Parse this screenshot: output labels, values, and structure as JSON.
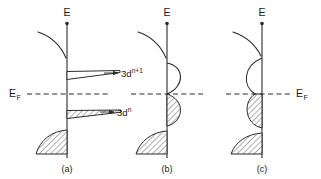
{
  "figure": {
    "background_color": "#ffffff",
    "line_color": "#2b2b2b",
    "energy_axis_label": "E",
    "fermi_label_main": "E",
    "fermi_label_sub": "F",
    "panels": [
      {
        "id": "a",
        "caption": "(a)",
        "axis_x": 67,
        "description": "Narrow atomic-like 3d levels: empty level above E_F, filled (hatched) level below E_F",
        "fermi_label_side": "left",
        "states": [
          {
            "name": "upper-level",
            "filled": false,
            "label_main": "3d",
            "label_sup": "n+1"
          },
          {
            "name": "lower-level",
            "filled": true,
            "label_main": "3d",
            "label_sup": "n"
          }
        ]
      },
      {
        "id": "b",
        "caption": "(b)",
        "axis_x": 167,
        "description": "Two separated 3d sub-bands split across E_F; lower sub-band filled (hatched)",
        "fermi_label_side": "none",
        "states": [
          {
            "name": "upper-subband",
            "filled": false
          },
          {
            "name": "lower-subband",
            "filled": true
          }
        ]
      },
      {
        "id": "c",
        "caption": "(c)",
        "axis_x": 262,
        "description": "Single broad 3d band crossing E_F; states below E_F filled (hatched)",
        "fermi_label_side": "right",
        "states": [
          {
            "name": "merged-band",
            "filled": "below-fermi"
          }
        ]
      }
    ],
    "level_labels": [
      {
        "name": "3d-n-plus-1-label",
        "main": "3d",
        "sup": "n+1"
      },
      {
        "name": "3d-n-label",
        "main": "3d",
        "sup": "n"
      }
    ],
    "panel_captions": [
      "(a)",
      "(b)",
      "(c)"
    ]
  }
}
